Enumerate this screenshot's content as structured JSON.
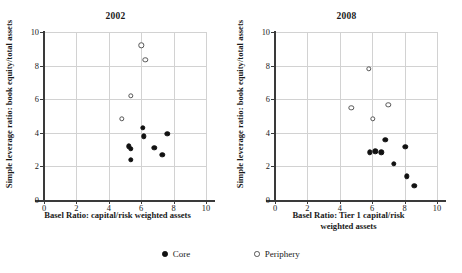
{
  "figure": {
    "legend": {
      "items": [
        {
          "label": "Core",
          "marker": "filled-circle"
        },
        {
          "label": "Periphery",
          "marker": "open-circle"
        }
      ]
    }
  },
  "chart_data": [
    {
      "type": "scatter",
      "title": "2002",
      "xlabel": "Basel Ratio: capital/risk weighted assets",
      "ylabel": "Simple leverage ratio: book equity/total assets",
      "xlim": [
        0,
        10
      ],
      "ylim": [
        0,
        10
      ],
      "xticks": [
        0,
        2,
        4,
        6,
        8,
        10
      ],
      "yticks": [
        0,
        2,
        4,
        6,
        8,
        10
      ],
      "grid": true,
      "legend_position": "below-figure",
      "series": [
        {
          "name": "Core",
          "marker": "filled-circle",
          "color": "#111111",
          "points": [
            {
              "x": 5.25,
              "y": 3.2
            },
            {
              "x": 5.35,
              "y": 3.05
            },
            {
              "x": 5.35,
              "y": 2.4
            },
            {
              "x": 6.1,
              "y": 4.3
            },
            {
              "x": 6.15,
              "y": 3.8
            },
            {
              "x": 6.8,
              "y": 3.1
            },
            {
              "x": 7.3,
              "y": 2.7
            },
            {
              "x": 7.6,
              "y": 3.95
            }
          ]
        },
        {
          "name": "Periphery",
          "marker": "open-circle",
          "color": "#555555",
          "points": [
            {
              "x": 6.0,
              "y": 9.2
            },
            {
              "x": 6.25,
              "y": 8.35
            },
            {
              "x": 5.35,
              "y": 6.2
            },
            {
              "x": 4.8,
              "y": 4.85
            }
          ]
        }
      ]
    },
    {
      "type": "scatter",
      "title": "2008",
      "xlabel": "Basel Ratio: Tier 1 capital/risk weighted assets",
      "xlabel_lines": [
        "Basel Ratio: Tier 1 capital/risk",
        "weighted assets"
      ],
      "ylabel": "Simple leverage ratio: book equity/total assets",
      "xlim": [
        0,
        10
      ],
      "ylim": [
        0,
        10
      ],
      "xticks": [
        0,
        2,
        4,
        6,
        8,
        10
      ],
      "yticks": [
        0,
        2,
        4,
        6,
        8,
        10
      ],
      "grid": true,
      "legend_position": "below-figure",
      "series": [
        {
          "name": "Core",
          "marker": "filled-circle",
          "color": "#111111",
          "points": [
            {
              "x": 5.85,
              "y": 2.85
            },
            {
              "x": 6.2,
              "y": 2.9
            },
            {
              "x": 6.55,
              "y": 2.85
            },
            {
              "x": 6.8,
              "y": 3.6
            },
            {
              "x": 7.35,
              "y": 2.15
            },
            {
              "x": 8.05,
              "y": 3.15
            },
            {
              "x": 8.15,
              "y": 1.4
            },
            {
              "x": 8.6,
              "y": 0.85
            }
          ]
        },
        {
          "name": "Periphery",
          "marker": "open-circle",
          "color": "#555555",
          "points": [
            {
              "x": 5.8,
              "y": 7.8
            },
            {
              "x": 4.7,
              "y": 5.5
            },
            {
              "x": 7.0,
              "y": 5.65
            },
            {
              "x": 6.05,
              "y": 4.85
            }
          ]
        }
      ]
    }
  ]
}
